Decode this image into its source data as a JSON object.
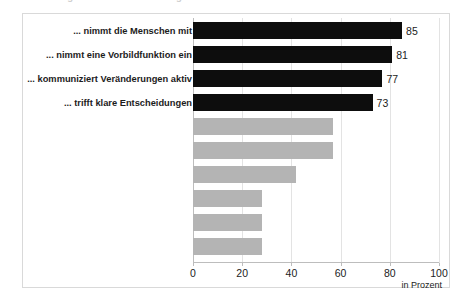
{
  "clipped_header": {
    "fragment_1": "Abbildung",
    "fragment_2": "g",
    "fragment_3": "r"
  },
  "chart_data": {
    "type": "bar",
    "orientation": "horizontal",
    "title": "",
    "xlabel": "in Prozent",
    "ylabel": "",
    "xlim": [
      0,
      100
    ],
    "xticks": [
      "0",
      "20",
      "40",
      "60",
      "80",
      "100"
    ],
    "xtick_values": [
      0,
      20,
      40,
      60,
      80,
      100
    ],
    "grid": "vertical",
    "legend": "none",
    "categories": [
      "... nimmt die Menschen mit",
      "... nimmt eine Vorbildfunktion ein",
      "... kommuniziert Veränderungen aktiv",
      "... trifft klare Entscheidungen",
      "",
      "",
      "",
      "",
      "",
      ""
    ],
    "values": [
      85,
      81,
      77,
      73,
      57,
      57,
      42,
      28,
      28,
      28
    ],
    "value_labels": [
      "85",
      "81",
      "77",
      "73",
      "",
      "",
      "",
      "",
      "",
      ""
    ],
    "bar_colors": [
      "#0d0d0d",
      "#0d0d0d",
      "#0d0d0d",
      "#0d0d0d",
      "#b4b4b4",
      "#b4b4b4",
      "#b4b4b4",
      "#b4b4b4",
      "#b4b4b4",
      "#b4b4b4"
    ]
  },
  "colors": {
    "highlight_bar": "#0d0d0d",
    "secondary_bar": "#b4b4b4",
    "gridline": "#e3e3e3",
    "frame_border": "#d9d9d9",
    "background": "#ffffff"
  }
}
